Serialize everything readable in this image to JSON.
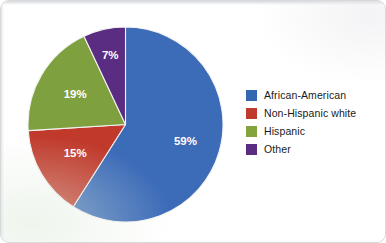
{
  "chart_data": {
    "type": "pie",
    "title": "",
    "subtitle": "",
    "xlabel": "",
    "ylabel": "",
    "grid": false,
    "legend_position": "right",
    "start_angle_deg": 0,
    "direction": "clockwise",
    "categories": [
      "African-American",
      "Non-Hispanic white",
      "Hispanic",
      "Other"
    ],
    "values": [
      59,
      15,
      19,
      7
    ],
    "value_unit": "%",
    "data_labels": [
      "59%",
      "15%",
      "19%",
      "7%"
    ],
    "colors": [
      "#3C6BB8",
      "#C0392B",
      "#7FA03F",
      "#5B2D82"
    ],
    "slices": [
      {
        "label": "African-American",
        "value": 59,
        "data_label": "59%",
        "color": "#3C6BB8"
      },
      {
        "label": "Non-Hispanic white",
        "value": 15,
        "data_label": "15%",
        "color": "#C0392B"
      },
      {
        "label": "Hispanic",
        "value": 19,
        "data_label": "19%",
        "color": "#7FA03F"
      },
      {
        "label": "Other",
        "value": 7,
        "data_label": "7%",
        "color": "#5B2D82"
      }
    ]
  },
  "legend": {
    "items": [
      {
        "label": "African-American",
        "color": "#3268B0"
      },
      {
        "label": "Non-Hispanic white",
        "color": "#C0392F"
      },
      {
        "label": "Hispanic",
        "color": "#84A33C"
      },
      {
        "label": "Other",
        "color": "#5B2D82"
      }
    ]
  },
  "figure": {
    "background": "#FFFFFF",
    "border_color": "#D6D8DA",
    "label_text_color": "#FFFFFF"
  }
}
